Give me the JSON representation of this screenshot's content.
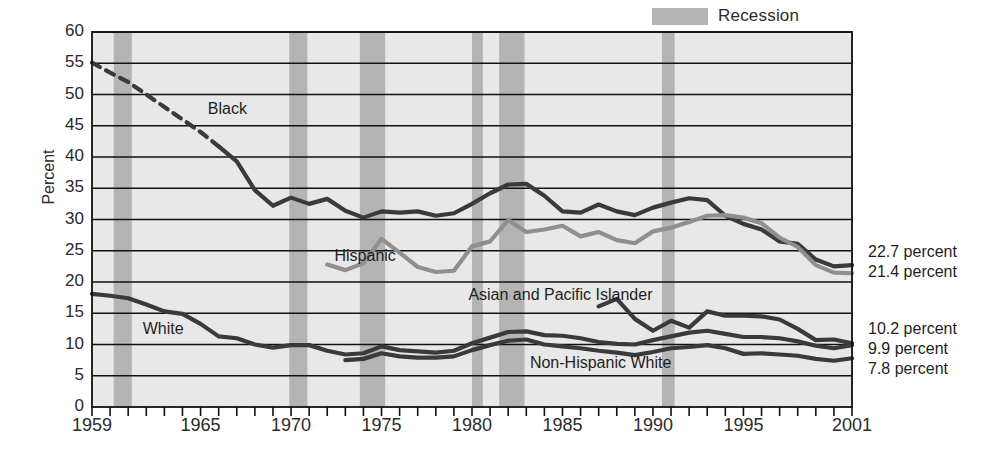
{
  "chart_data": {
    "type": "line",
    "title": "",
    "xlabel": "",
    "ylabel": "Percent",
    "xlim": [
      1959,
      2001
    ],
    "ylim": [
      0,
      60
    ],
    "grid": true,
    "legend_position": "top-right",
    "x_tick_labels": [
      "1959",
      "1965",
      "1970",
      "1975",
      "1980",
      "1985",
      "1990",
      "1995",
      "2001"
    ],
    "x_tick_values": [
      1959,
      1965,
      1970,
      1975,
      1980,
      1985,
      1990,
      1995,
      2001
    ],
    "y_tick_labels": [
      "0",
      "5",
      "10",
      "15",
      "20",
      "25",
      "30",
      "35",
      "40",
      "45",
      "50",
      "55",
      "60"
    ],
    "y_tick_values": [
      0,
      5,
      10,
      15,
      20,
      25,
      30,
      35,
      40,
      45,
      50,
      55,
      60
    ],
    "legend": [
      {
        "label": "Recession",
        "color": "#b4b4b4",
        "type": "band"
      }
    ],
    "recession_bands": [
      {
        "start": 1960.2,
        "end": 1961.2
      },
      {
        "start": 1969.9,
        "end": 1970.9
      },
      {
        "start": 1973.8,
        "end": 1975.2
      },
      {
        "start": 1980.0,
        "end": 1980.6
      },
      {
        "start": 1981.5,
        "end": 1982.9
      },
      {
        "start": 1990.5,
        "end": 1991.2
      },
      {
        "start": 2001.0,
        "end": 2001.6
      }
    ],
    "series": [
      {
        "name": "Black",
        "color": "#3a3a3a",
        "label_x": 1965.4,
        "label_y": 47.5,
        "dashed_until": 1966,
        "x": [
          1959,
          1960,
          1961,
          1962,
          1963,
          1964,
          1965,
          1966,
          1967,
          1968,
          1969,
          1970,
          1971,
          1972,
          1973,
          1974,
          1975,
          1976,
          1977,
          1978,
          1979,
          1980,
          1981,
          1982,
          1983,
          1984,
          1985,
          1986,
          1987,
          1988,
          1989,
          1990,
          1991,
          1992,
          1993,
          1994,
          1995,
          1996,
          1997,
          1998,
          1999,
          2000,
          2001
        ],
        "values": [
          55.1,
          53.5,
          52.0,
          50.0,
          48.0,
          46.0,
          44.0,
          41.7,
          39.3,
          34.7,
          32.2,
          33.5,
          32.5,
          33.3,
          31.4,
          30.3,
          31.3,
          31.1,
          31.3,
          30.6,
          31.0,
          32.5,
          34.2,
          35.6,
          35.7,
          33.8,
          31.3,
          31.1,
          32.4,
          31.3,
          30.7,
          31.9,
          32.7,
          33.4,
          33.1,
          30.6,
          29.3,
          28.4,
          26.5,
          26.1,
          23.6,
          22.5,
          22.7
        ]
      },
      {
        "name": "Hispanic",
        "color": "#8f8f8f",
        "label_x": 1972.4,
        "label_y": 24.0,
        "x": [
          1972,
          1973,
          1974,
          1975,
          1976,
          1977,
          1978,
          1979,
          1980,
          1981,
          1982,
          1983,
          1984,
          1985,
          1986,
          1987,
          1988,
          1989,
          1990,
          1991,
          1992,
          1993,
          1994,
          1995,
          1996,
          1997,
          1998,
          1999,
          2000,
          2001
        ],
        "values": [
          22.8,
          21.9,
          23.0,
          26.9,
          24.7,
          22.4,
          21.6,
          21.8,
          25.7,
          26.5,
          29.9,
          28.0,
          28.4,
          29.0,
          27.3,
          28.0,
          26.7,
          26.2,
          28.1,
          28.7,
          29.6,
          30.6,
          30.7,
          30.3,
          29.4,
          27.1,
          25.6,
          22.7,
          21.5,
          21.4
        ]
      },
      {
        "name": "Asian and Pacific Islander",
        "color": "#3a3a3a",
        "label_x": 1979.8,
        "label_y": 17.8,
        "x": [
          1987,
          1988,
          1989,
          1990,
          1991,
          1992,
          1993,
          1994,
          1995,
          1996,
          1997,
          1998,
          1999,
          2000,
          2001
        ],
        "values": [
          16.1,
          17.3,
          14.1,
          12.2,
          13.8,
          12.7,
          15.3,
          14.6,
          14.6,
          14.5,
          14.0,
          12.5,
          10.7,
          10.8,
          10.2
        ]
      },
      {
        "name": "White",
        "color": "#3a3a3a",
        "label_x": 1961.8,
        "label_y": 12.3,
        "x": [
          1959,
          1960,
          1961,
          1962,
          1963,
          1964,
          1965,
          1966,
          1967,
          1968,
          1969,
          1970,
          1971,
          1972,
          1973,
          1974,
          1975,
          1976,
          1977,
          1978,
          1979,
          1980,
          1981,
          1982,
          1983,
          1984,
          1985,
          1986,
          1987,
          1988,
          1989,
          1990,
          1991,
          1992,
          1993,
          1994,
          1995,
          1996,
          1997,
          1998,
          1999,
          2000,
          2001
        ],
        "values": [
          18.1,
          17.8,
          17.4,
          16.4,
          15.3,
          14.9,
          13.3,
          11.3,
          11.0,
          10.0,
          9.5,
          9.9,
          9.9,
          9.0,
          8.4,
          8.6,
          9.7,
          9.1,
          8.9,
          8.7,
          9.0,
          10.2,
          11.1,
          12.0,
          12.1,
          11.5,
          11.4,
          11.0,
          10.4,
          10.1,
          10.0,
          10.7,
          11.3,
          11.9,
          12.2,
          11.7,
          11.2,
          11.2,
          11.0,
          10.5,
          9.8,
          9.4,
          9.9
        ]
      },
      {
        "name": "Non-Hispanic White",
        "color": "#3a3a3a",
        "label_x": 1983.2,
        "label_y": 6.9,
        "x": [
          1973,
          1974,
          1975,
          1976,
          1977,
          1978,
          1979,
          1980,
          1981,
          1982,
          1983,
          1984,
          1985,
          1986,
          1987,
          1988,
          1989,
          1990,
          1991,
          1992,
          1993,
          1994,
          1995,
          1996,
          1997,
          1998,
          1999,
          2000,
          2001
        ],
        "values": [
          7.5,
          7.7,
          8.6,
          8.1,
          7.9,
          7.9,
          8.1,
          9.1,
          9.9,
          10.6,
          10.8,
          10.0,
          9.7,
          9.4,
          9.0,
          8.7,
          8.3,
          8.8,
          9.4,
          9.6,
          9.9,
          9.4,
          8.5,
          8.6,
          8.4,
          8.2,
          7.7,
          7.4,
          7.8
        ]
      }
    ],
    "end_labels": [
      {
        "text": "22.7 percent",
        "value": 22.7,
        "top": 243
      },
      {
        "text": "21.4 percent",
        "value": 21.4,
        "top": 263
      },
      {
        "text": "10.2 percent",
        "value": 10.2,
        "top": 320
      },
      {
        "text": "9.9 percent",
        "value": 9.9,
        "top": 340
      },
      {
        "text": "7.8 percent",
        "value": 7.8,
        "top": 360
      }
    ]
  }
}
